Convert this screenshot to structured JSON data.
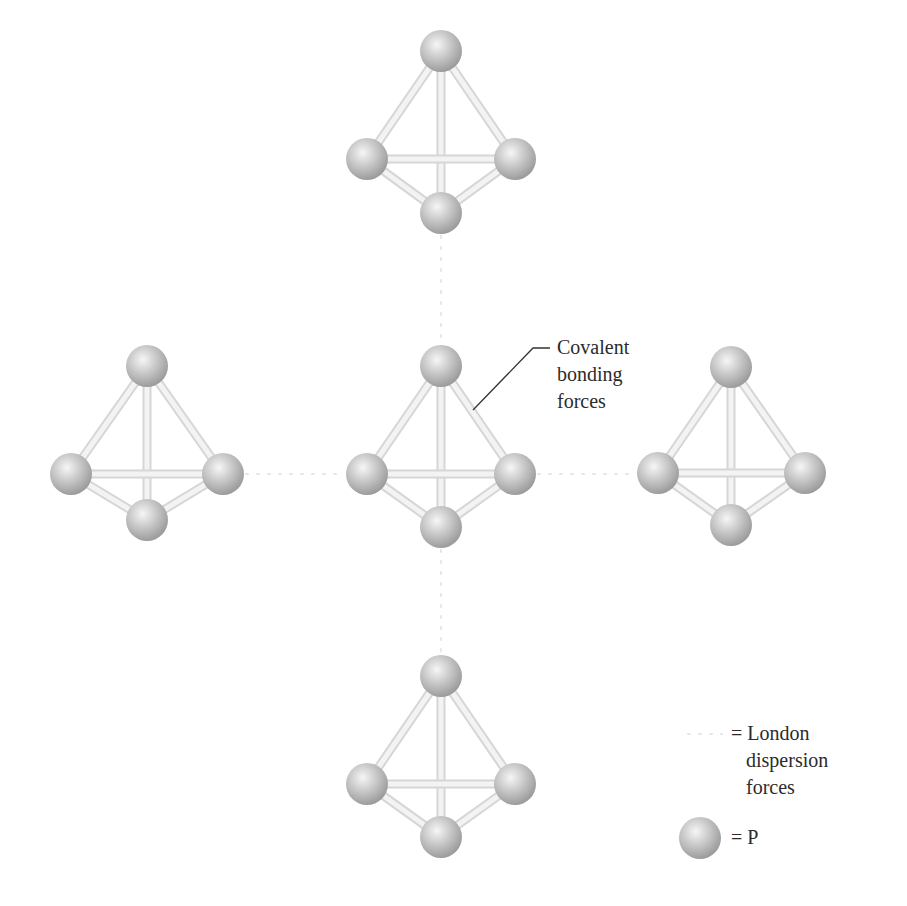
{
  "figure": {
    "atom_color": {
      "highlight": "#f4f4f4",
      "mid": "#c8c8c8",
      "edge": "#9e9e9e"
    },
    "bond_color": "#e2e2e2",
    "dispersion_color": "#e6e6e6",
    "leader_color": "#333333"
  },
  "molecules": [
    {
      "id": "top",
      "atoms": [
        [
          441,
          51
        ],
        [
          367,
          159
        ],
        [
          515,
          159
        ],
        [
          441,
          213
        ]
      ]
    },
    {
      "id": "left",
      "atoms": [
        [
          147,
          366
        ],
        [
          71,
          474
        ],
        [
          223,
          474
        ],
        [
          147,
          520
        ]
      ]
    },
    {
      "id": "center",
      "atoms": [
        [
          441,
          366
        ],
        [
          367,
          474
        ],
        [
          515,
          474
        ],
        [
          441,
          527
        ]
      ]
    },
    {
      "id": "right",
      "atoms": [
        [
          731,
          367
        ],
        [
          658,
          473
        ],
        [
          805,
          473
        ],
        [
          731,
          525
        ]
      ]
    },
    {
      "id": "bottom",
      "atoms": [
        [
          441,
          676
        ],
        [
          367,
          784
        ],
        [
          515,
          784
        ],
        [
          441,
          837
        ]
      ]
    }
  ],
  "dispersion_links": [
    [
      441,
      236,
      441,
      345
    ],
    [
      441,
      550,
      441,
      655
    ],
    [
      246,
      474,
      344,
      474
    ],
    [
      538,
      474,
      636,
      474
    ]
  ],
  "annotations": {
    "covalent": {
      "lines": [
        "Covalent",
        "bonding",
        "forces"
      ],
      "leader": [
        [
          473,
          410
        ],
        [
          533,
          348
        ],
        [
          550,
          348
        ]
      ]
    }
  },
  "legend": {
    "dispersion": {
      "lines": [
        "= London",
        "dispersion",
        "forces"
      ]
    },
    "atom": {
      "label": "= P"
    }
  }
}
